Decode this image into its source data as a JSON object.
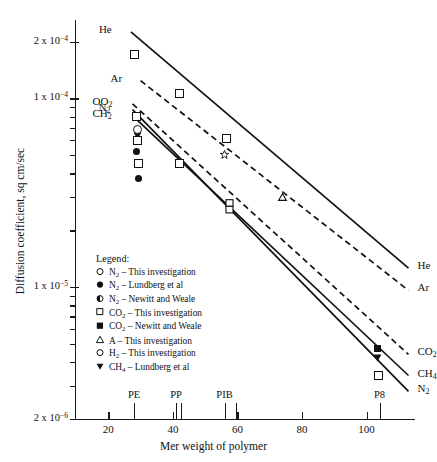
{
  "chart_data": {
    "type": "line",
    "title": "",
    "xlabel": "Mer weight of polymer",
    "ylabel": "Diffusion coefficient, sq cm/sec",
    "xlim": [
      10,
      115
    ],
    "ylim": [
      2e-06,
      0.00026
    ],
    "yscale": "log",
    "xscale": "linear",
    "grid": false,
    "legend_position": "inside-lower-left",
    "xticks": [
      "20",
      "40",
      "60",
      "80",
      "100"
    ],
    "xtick_values": [
      20,
      40,
      60,
      80,
      100
    ],
    "ytick_labels": [
      "2 x 10-4",
      "1 x 10-4",
      "1 x 10-5",
      "2 x 10-6"
    ],
    "ytick_values": [
      0.0002,
      0.0001,
      1e-05,
      2e-06
    ],
    "polymer_markers": [
      {
        "label": "PE",
        "x": 28
      },
      {
        "label": "PP",
        "x": 41
      },
      {
        "label": "PIB",
        "x": 56
      },
      {
        "label": "P8",
        "x": 104
      }
    ],
    "extra_xticks": [
      42.5,
      59.5
    ],
    "series": [
      {
        "name": "He",
        "left_label": "He",
        "right_label": "He",
        "style": "solid",
        "x": [
          27.0,
          113.0
        ],
        "y": [
          0.000225,
          1.26e-05
        ],
        "points": [
          {
            "x": 28.0,
            "y": 0.000172,
            "marker": "open-square"
          },
          {
            "x": 42.0,
            "y": 0.0001065,
            "marker": "open-square"
          },
          {
            "x": 56.5,
            "y": 6.15e-05,
            "marker": "open-square"
          }
        ]
      },
      {
        "name": "Ar",
        "left_label": "Ar",
        "right_label": "Ar",
        "style": "dashed",
        "x": [
          30.0,
          113.0
        ],
        "y": [
          0.000124,
          9.6e-06
        ],
        "points": [
          {
            "x": 56.0,
            "y": 5.05e-05,
            "marker": "open-star"
          },
          {
            "x": 74.0,
            "y": 3e-05,
            "marker": "open-triangle"
          }
        ]
      },
      {
        "name": "CO2",
        "left_label": "OO2",
        "right_label": "CO2",
        "style": "dashed",
        "x": [
          27.5,
          113.0
        ],
        "y": [
          9.35e-05,
          4.4e-06
        ],
        "points": [
          {
            "x": 28.5,
            "y": 8.05e-05,
            "marker": "open-square"
          },
          {
            "x": 42.0,
            "y": 4.55e-05,
            "marker": "open-square"
          },
          {
            "x": 57.5,
            "y": 2.68e-05,
            "marker": "double-square"
          },
          {
            "x": 103.5,
            "y": 4.7e-06,
            "marker": "filled-square"
          }
        ]
      },
      {
        "name": "CH4",
        "left_label": "CH2",
        "right_label": "CH4",
        "style": "solid",
        "x": [
          27.5,
          113.0
        ],
        "y": [
          8.1e-05,
          3.4e-06
        ],
        "points": [
          {
            "x": 29.0,
            "y": 6.35e-05,
            "marker": "filled-triangle-down"
          },
          {
            "x": 103.5,
            "y": 4.2e-06,
            "marker": "filled-triangle-down"
          }
        ]
      },
      {
        "name": "N2",
        "left_label": "N2",
        "right_label": "N2",
        "style": "solid",
        "x": [
          27.5,
          113.0
        ],
        "y": [
          8.7e-05,
          2.8e-06
        ],
        "points": [
          {
            "x": 28.8,
            "y": 6.9e-05,
            "marker": "open-circle"
          },
          {
            "x": 28.8,
            "y": 6e-05,
            "marker": "open-square"
          },
          {
            "x": 28.9,
            "y": 5.2e-05,
            "marker": "filled-circle"
          },
          {
            "x": 29.2,
            "y": 4.55e-05,
            "marker": "open-square"
          },
          {
            "x": 29.5,
            "y": 3.75e-05,
            "marker": "filled-circle"
          },
          {
            "x": 103.5,
            "y": 3.4e-06,
            "marker": "open-square"
          }
        ]
      }
    ],
    "legend": {
      "title": "Legend:",
      "entries": [
        {
          "marker": "open-circle",
          "gas": "N2",
          "separator": "–",
          "source": "This investigation"
        },
        {
          "marker": "filled-circle",
          "gas": "N2",
          "separator": "–",
          "source": "Lundberg et al"
        },
        {
          "marker": "half-filled-circle",
          "gas": "N2",
          "separator": "–",
          "source": "Newitt and Weale"
        },
        {
          "marker": "open-square",
          "gas": "CO2",
          "separator": "–",
          "source": "This investigation"
        },
        {
          "marker": "filled-square",
          "gas": "CO2",
          "separator": "–",
          "source": "Newitt and Weale"
        },
        {
          "marker": "open-triangle",
          "gas": "A",
          "separator": "–",
          "source": "This investigation"
        },
        {
          "marker": "open-circle",
          "gas": "H2",
          "separator": "–",
          "source": "This investigation"
        },
        {
          "marker": "filled-triangle-down",
          "gas": "CH4",
          "separator": "–",
          "source": "Lundberg et al"
        }
      ]
    },
    "colors": {
      "ink": "#111111",
      "axis": "#1a1a1a",
      "background": "#ffffff"
    }
  }
}
